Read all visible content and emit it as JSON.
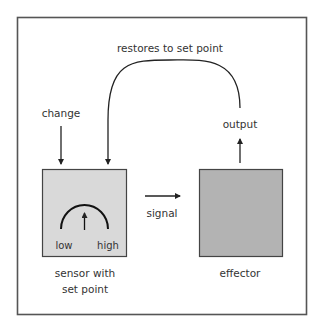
{
  "diagram": {
    "title": "",
    "colors": {
      "frame": "#555555",
      "line": "#222222",
      "text": "#333333",
      "sensor_fill": "#d9d9d9",
      "effector_fill": "#b3b3b3"
    },
    "labels": {
      "feedback": "restores to set point",
      "change": "change",
      "output": "output",
      "signal": "signal",
      "gauge_low": "low",
      "gauge_high": "high",
      "sensor_line1": "sensor with",
      "sensor_line2": "set point",
      "effector": "effector"
    },
    "nodes": [
      {
        "id": "sensor",
        "label": "sensor with set point"
      },
      {
        "id": "effector",
        "label": "effector"
      }
    ],
    "edges": [
      {
        "from": "external",
        "to": "sensor",
        "label": "change"
      },
      {
        "from": "sensor",
        "to": "effector",
        "label": "signal"
      },
      {
        "from": "effector",
        "to": "output",
        "label": "output"
      },
      {
        "from": "output",
        "to": "sensor",
        "label": "restores to set point"
      }
    ]
  }
}
